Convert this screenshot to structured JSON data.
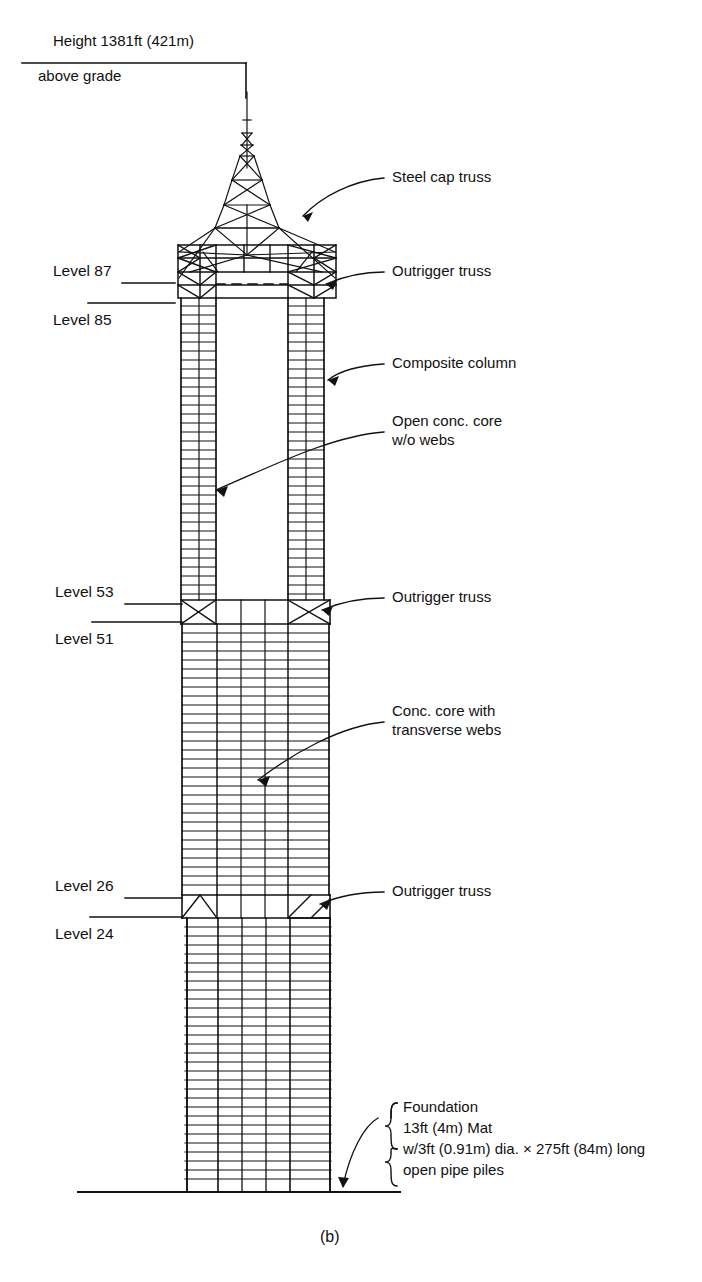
{
  "figure": {
    "caption": "(b)",
    "height_note_line1": "Height 1381ft (421m)",
    "height_note_line2": "above grade"
  },
  "levels": [
    {
      "name": "level-87",
      "label": "Level 87"
    },
    {
      "name": "level-85",
      "label": "Level 85"
    },
    {
      "name": "level-53",
      "label": "Level 53"
    },
    {
      "name": "level-51",
      "label": "Level 51"
    },
    {
      "name": "level-26",
      "label": "Level 26"
    },
    {
      "name": "level-24",
      "label": "Level 24"
    }
  ],
  "callouts": [
    {
      "name": "steel-cap-truss",
      "label": "Steel cap truss"
    },
    {
      "name": "outrigger-truss-top",
      "label": "Outrigger truss"
    },
    {
      "name": "composite-column",
      "label": "Composite column"
    },
    {
      "name": "open-conc-core",
      "label": "Open conc. core\nw/o webs"
    },
    {
      "name": "outrigger-truss-mid",
      "label": "Outrigger truss"
    },
    {
      "name": "conc-core-webs",
      "label": "Conc. core with\ntransverse webs"
    },
    {
      "name": "outrigger-truss-low",
      "label": "Outrigger truss"
    }
  ],
  "foundation_note": {
    "line1": "Foundation",
    "line2": "13ft (4m) Mat",
    "line3": "w/3ft (0.91m) dia. × 275ft (84m) long",
    "line4": "open pipe piles"
  },
  "colors": {
    "ink": "#111111",
    "background": "#ffffff"
  }
}
